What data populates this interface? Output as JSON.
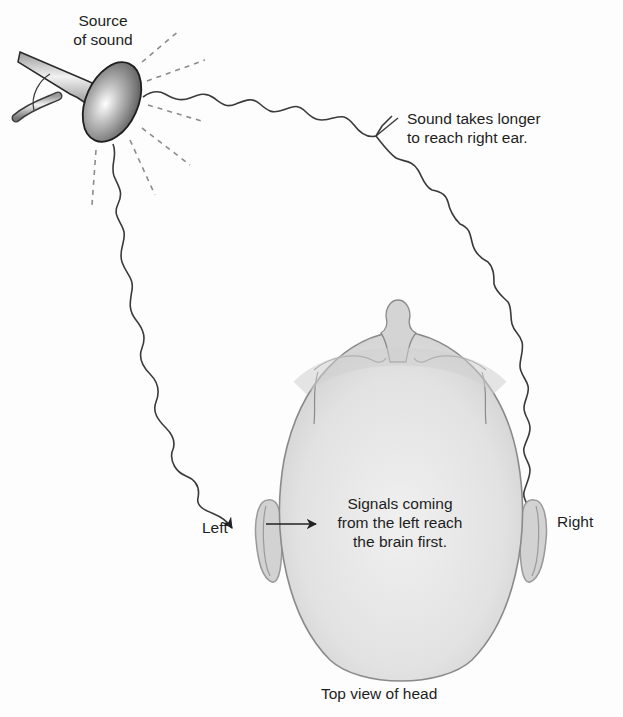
{
  "labels": {
    "source_line1": "Source",
    "source_line2": "of sound",
    "longer_line1": "Sound takes longer",
    "longer_line2": "to reach right ear.",
    "signals_line1": "Signals coming",
    "signals_line2": "from the left reach",
    "signals_line3": "the brain first.",
    "left": "Left",
    "right": "Right",
    "caption": "Top view of head"
  },
  "colors": {
    "head_fill": "#dcdcdc",
    "head_stroke": "#8a8a8a",
    "wave": "#3a3a3a",
    "dash": "#8c8c8c",
    "text": "#1e1e1e"
  }
}
